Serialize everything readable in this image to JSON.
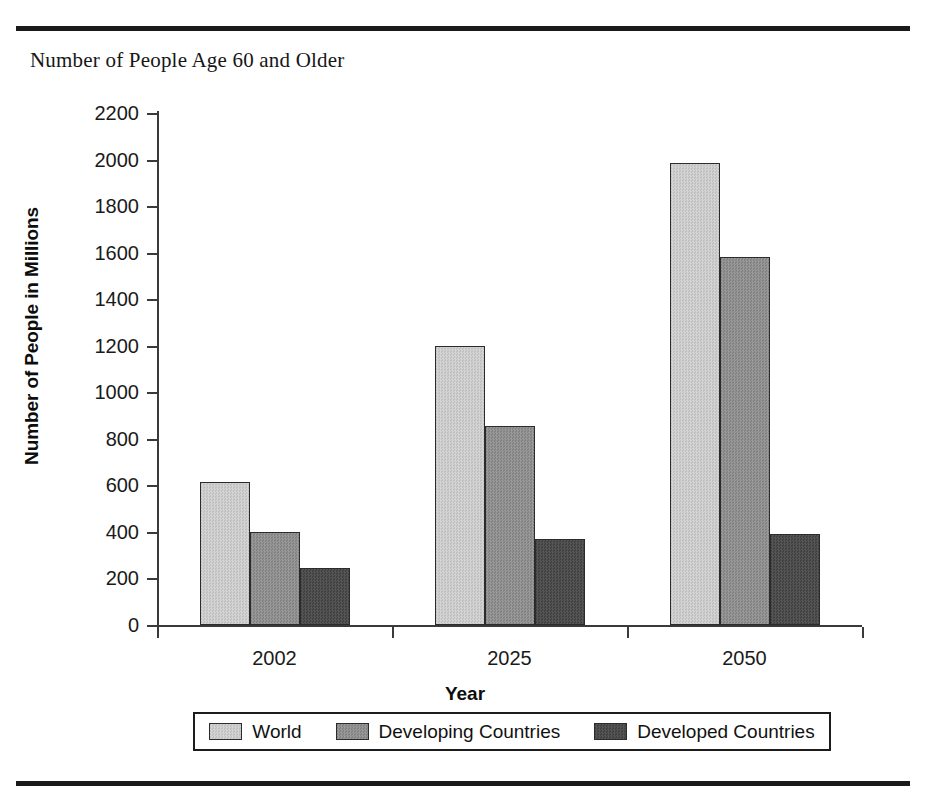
{
  "figure": {
    "title": "Number of People Age 60 and Older"
  },
  "chart_data": {
    "type": "bar",
    "title": "Number of People Age 60 and Older",
    "xlabel": "Year",
    "ylabel": "Number of People in Millions",
    "categories": [
      "2002",
      "2025",
      "2050"
    ],
    "series": [
      {
        "name": "World",
        "values": [
          615,
          1200,
          1985
        ],
        "color": "#cbcbcb"
      },
      {
        "name": "Developing Countries",
        "values": [
          400,
          855,
          1580
        ],
        "color": "#8d8d8d"
      },
      {
        "name": "Developed Countries",
        "values": [
          245,
          370,
          390
        ],
        "color": "#4b4b4b"
      }
    ],
    "ylim": [
      0,
      2200
    ],
    "yticks": [
      0,
      200,
      400,
      600,
      800,
      1000,
      1200,
      1400,
      1600,
      1800,
      2000,
      2200
    ],
    "ytick_labels": [
      "0",
      "200",
      "400",
      "600",
      "800",
      "1000",
      "1200",
      "1400",
      "1600",
      "1800",
      "2000",
      "2200"
    ],
    "grid": false,
    "legend_position": "bottom"
  },
  "legend": {
    "items": [
      {
        "label": "World"
      },
      {
        "label": "Developing Countries"
      },
      {
        "label": "Developed Countries"
      }
    ]
  }
}
